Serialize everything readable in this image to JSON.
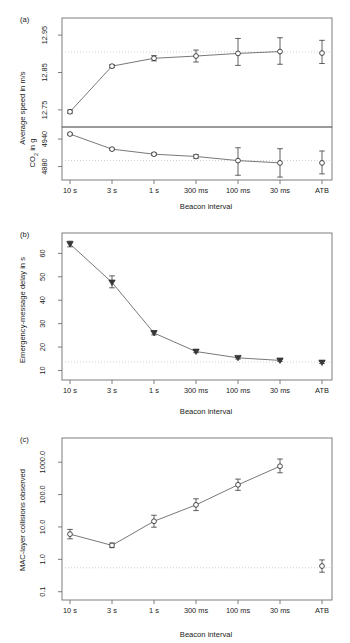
{
  "figure": {
    "shared_xlabel": "Beacon interval",
    "categories": [
      "10 s",
      "3 s",
      "1 s",
      "300 ms",
      "100 ms",
      "30 ms",
      "ATB"
    ],
    "colors": {
      "frame": "#6f6f6f",
      "line": "#555555",
      "marker": "#2b2b2b",
      "reference_line": "#c8c8c8",
      "background": "#ffffff"
    }
  },
  "chart_data": [
    {
      "type": "line",
      "panel_label": "(a)",
      "subpanel": "top",
      "title": "",
      "xlabel": "Beacon interval",
      "ylabel": "Average speed in m/s",
      "categories": [
        "10 s",
        "3 s",
        "1 s",
        "300 ms",
        "100 ms",
        "30 ms",
        "ATB"
      ],
      "ytick_labels": [
        "12.75",
        "12.85",
        "12.95"
      ],
      "ytick_values": [
        12.75,
        12.85,
        12.95
      ],
      "ylim": [
        12.715,
        12.985
      ],
      "grid": false,
      "legend": "none",
      "reference_line": 12.905,
      "series": [
        {
          "name": "Average speed",
          "marker": "open-circle",
          "connected_points": 6,
          "values": [
            12.745,
            12.867,
            12.888,
            12.894,
            12.901,
            12.906,
            12.902
          ],
          "err_low": [
            12.741,
            12.863,
            12.881,
            12.878,
            12.869,
            12.872,
            12.874
          ],
          "err_high": [
            12.75,
            12.871,
            12.895,
            12.91,
            12.941,
            12.943,
            12.936
          ]
        }
      ]
    },
    {
      "type": "line",
      "panel_label": "(a)",
      "subpanel": "bottom",
      "title": "",
      "xlabel": "Beacon interval",
      "ylabel": "CO2 in g",
      "ylabel_html": "CO<sub>2</sub> in g",
      "categories": [
        "10 s",
        "3 s",
        "1 s",
        "300 ms",
        "100 ms",
        "30 ms",
        "ATB"
      ],
      "ytick_labels": [
        "4880",
        "4940"
      ],
      "ytick_values": [
        4880,
        4940
      ],
      "ylim": [
        4855,
        4962
      ],
      "grid": false,
      "legend": "none",
      "reference_line": 4893,
      "series": [
        {
          "name": "CO2 emissions",
          "marker": "open-circle",
          "connected_points": 6,
          "values": [
            4951,
            4918,
            4907,
            4902,
            4893,
            4888,
            4888
          ],
          "err_low": [
            4949,
            4916,
            4904,
            4898,
            4861,
            4857,
            4864
          ],
          "err_high": [
            4953,
            4920,
            4910,
            4906,
            4921,
            4919,
            4914
          ]
        }
      ]
    },
    {
      "type": "line",
      "panel_label": "(b)",
      "title": "",
      "xlabel": "Beacon interval",
      "ylabel": "Emergency-message delay in s",
      "categories": [
        "10 s",
        "3 s",
        "1 s",
        "300 ms",
        "100 ms",
        "30 ms",
        "ATB"
      ],
      "ytick_labels": [
        "10",
        "20",
        "30",
        "40",
        "50",
        "60"
      ],
      "ytick_values": [
        10,
        20,
        30,
        40,
        50,
        60
      ],
      "ylim": [
        8.5,
        67
      ],
      "grid": false,
      "legend": "none",
      "reference_line": 13.6,
      "series": [
        {
          "name": "Emergency-message delay",
          "marker": "filled-down-triangle",
          "connected_points": 6,
          "values": [
            64.0,
            47.6,
            26.0,
            18.1,
            15.4,
            14.3,
            13.4
          ],
          "err_low": [
            62.8,
            45.3,
            25.2,
            17.6,
            14.9,
            13.9,
            13.0
          ],
          "err_high": [
            65.2,
            50.4,
            26.9,
            18.7,
            16.0,
            14.8,
            13.9
          ]
        }
      ]
    },
    {
      "type": "line",
      "panel_label": "(c)",
      "title": "",
      "xlabel": "Beacon interval",
      "ylabel": "MAC-layer collisions observed",
      "categories": [
        "10 s",
        "3 s",
        "1 s",
        "300 ms",
        "100 ms",
        "30 ms",
        "ATB"
      ],
      "ytick_labels": [
        "0.1",
        "1.0",
        "10.0",
        "100.0",
        "1000.0"
      ],
      "ytick_values": [
        0.1,
        1,
        10,
        100,
        1000
      ],
      "yscale": "log",
      "ylim": [
        0.085,
        4200
      ],
      "grid": false,
      "legend": "none",
      "reference_line": 0.55,
      "series": [
        {
          "name": "MAC-layer collisions",
          "marker": "open-circle",
          "connected_points": 6,
          "values": [
            6.0,
            2.7,
            15.0,
            48.0,
            200.0,
            750.0,
            0.62
          ],
          "err_low": [
            4.3,
            2.3,
            9.8,
            32.0,
            135.0,
            470.0,
            0.4
          ],
          "err_high": [
            8.4,
            3.2,
            23.0,
            74.0,
            300.0,
            1250.0,
            0.96
          ]
        }
      ]
    }
  ]
}
